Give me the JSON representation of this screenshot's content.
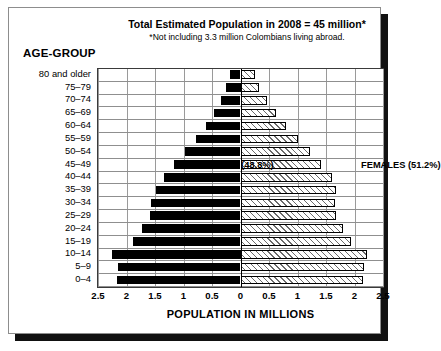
{
  "figure": {
    "title": "Total Estimated Population in 2008 = 45 million*",
    "subtitle": "*Not including 3.3 million Colombians living abroad.",
    "age_axis_title": "AGE-GROUP",
    "bottom_clipped_caption": ""
  },
  "chart_data": {
    "type": "bar",
    "subtype": "population-pyramid",
    "title": "Total Estimated Population in 2008 = 45 million*",
    "subtitle": "*Not including 3.3 million Colombians living abroad.",
    "xlabel": "POPULATION IN MILLIONS",
    "ylabel": "AGE-GROUP",
    "grid": true,
    "legend_position": "inside-plot",
    "xlim": [
      -2.5,
      2.5
    ],
    "xticks": [
      -2.5,
      -2,
      -1.5,
      -1,
      -0.5,
      0,
      0.5,
      1,
      1.5,
      2,
      2.5
    ],
    "xtick_labels": [
      "2.5",
      "2",
      "1.5",
      "1",
      "0.5",
      "0",
      "0.5",
      "1",
      "1.5",
      "2",
      "2.5"
    ],
    "categories": [
      "80 and older",
      "75–79",
      "70–74",
      "65–69",
      "60–64",
      "55–59",
      "50–54",
      "45–49",
      "40–44",
      "35–39",
      "30–34",
      "25–29",
      "20–24",
      "15–19",
      "10–14",
      "5–9",
      "0–4"
    ],
    "series": [
      {
        "name": "MALES (48.8%)",
        "short_name": "MALES",
        "share_percent": 48.8,
        "side": "left",
        "fill": "solid-black",
        "color": "#000000",
        "values": [
          0.18,
          0.25,
          0.35,
          0.47,
          0.6,
          0.78,
          0.97,
          1.17,
          1.35,
          1.48,
          1.57,
          1.58,
          1.72,
          1.88,
          2.25,
          2.15,
          2.16
        ]
      },
      {
        "name": "FEMALES (51.2%)",
        "short_name": "FEMALES",
        "share_percent": 51.2,
        "side": "right",
        "fill": "hatched",
        "color": "#f2f2f2",
        "values": [
          0.26,
          0.33,
          0.47,
          0.63,
          0.8,
          1.0,
          1.22,
          1.42,
          1.6,
          1.67,
          1.65,
          1.67,
          1.8,
          1.93,
          2.22,
          2.16,
          2.15
        ]
      }
    ]
  }
}
